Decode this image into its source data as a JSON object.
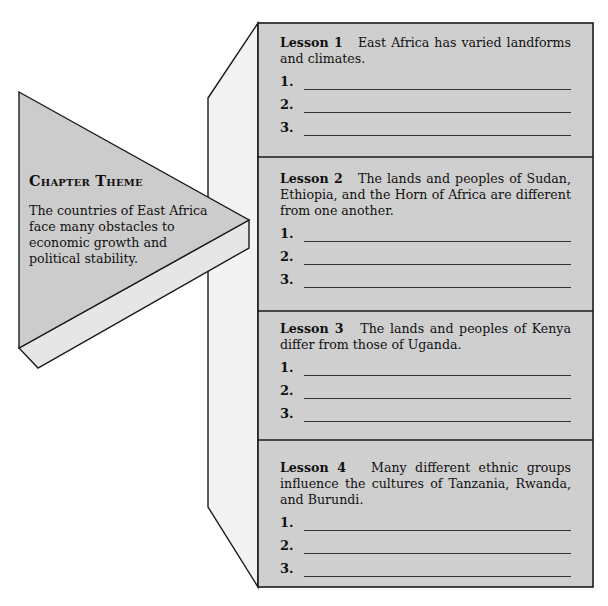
{
  "chapter_theme": {
    "title": "Chapter Theme",
    "text": "The countries of East Africa face many obstacles to economic growth and political stability."
  },
  "lessons": [
    {
      "label": "Lesson 1",
      "text": "East Africa has varied landforms and climates.",
      "blanks": [
        "1.",
        "2.",
        "3."
      ]
    },
    {
      "label": "Lesson 2",
      "text": "The lands and peoples of Sudan, Ethiopia, and the Horn of Africa are different from one another.",
      "blanks": [
        "1.",
        "2.",
        "3."
      ]
    },
    {
      "label": "Lesson 3",
      "text": "The lands and peoples of Kenya differ from those of Uganda.",
      "blanks": [
        "1.",
        "2.",
        "3."
      ]
    },
    {
      "label": "Lesson 4",
      "text": "Many different ethnic groups influence the cultures of Tanzania, Rwanda, and Burundi.",
      "blanks": [
        "1.",
        "2.",
        "3."
      ]
    }
  ],
  "colors": {
    "panel_fill": "#cfcfcf",
    "side_fill": "#f2f2f2",
    "edge_fill": "#e4e4e4",
    "stroke": "#1a1a1a"
  }
}
